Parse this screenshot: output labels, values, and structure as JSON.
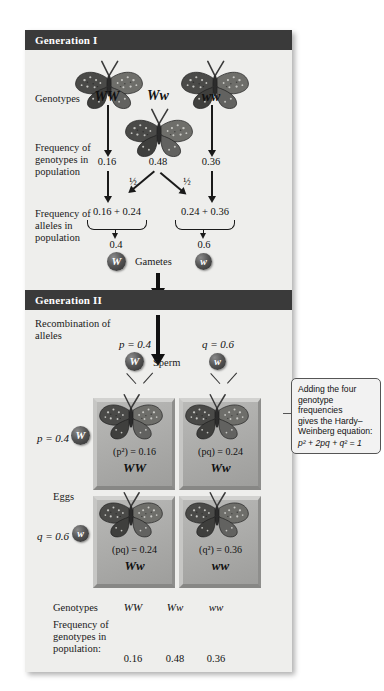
{
  "figure": {
    "generation1_header": "Generation I",
    "generation2_header": "Generation II",
    "row_labels": {
      "genotypes": "Genotypes",
      "freq_genotypes": "Frequency of genotypes in population",
      "freq_alleles": "Frequency of alleles in population",
      "recombination": "Recombination of alleles",
      "gametes": "Gametes",
      "sperm": "Sperm",
      "eggs": "Eggs"
    },
    "gen1": {
      "genotypes": [
        "WW",
        "Ww",
        "ww"
      ],
      "genotype_frequencies": [
        "0.16",
        "0.48",
        "0.36"
      ],
      "half_labels": [
        "½",
        "½"
      ],
      "allele_sums": [
        "0.16 + 0.24",
        "0.24 + 0.36"
      ],
      "allele_frequencies": [
        "0.4",
        "0.6"
      ],
      "gamete_alleles": [
        "W",
        "w"
      ]
    },
    "gen2": {
      "sperm_freq": [
        "p = 0.4",
        "q = 0.6"
      ],
      "sperm_alleles": [
        "W",
        "w"
      ],
      "egg_freq": [
        "p = 0.4",
        "q = 0.6"
      ],
      "egg_alleles": [
        "W",
        "w"
      ],
      "punnett": [
        {
          "expr": "(p²) = 0.16",
          "genotype": "WW"
        },
        {
          "expr": "(pq) = 0.24",
          "genotype": "Ww"
        },
        {
          "expr": "(pq) = 0.24",
          "genotype": "Ww"
        },
        {
          "expr": "(q²) = 0.36",
          "genotype": "ww"
        }
      ]
    },
    "summary": {
      "genotypes_label": "Genotypes",
      "frequency_label": "Frequency of genotypes in population:",
      "genotypes": [
        "WW",
        "Ww",
        "ww"
      ],
      "frequencies": [
        "0.16",
        "0.48",
        "0.36"
      ]
    },
    "callout": {
      "line1": "Adding the four",
      "line2": "genotype frequencies",
      "line3": "gives the Hardy–",
      "line4": "Weinberg equation:",
      "equation": "p² + 2pq + q² = 1"
    },
    "colors": {
      "header_bar": "#3a3a3a",
      "panel_bg": "#eeeeec",
      "cell_fill": "#aaaaa8"
    }
  }
}
